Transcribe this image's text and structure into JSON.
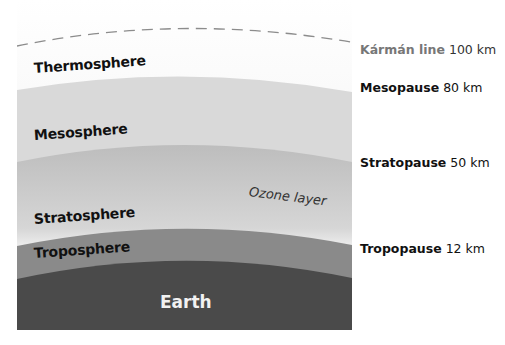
{
  "diagram": {
    "layers": [
      {
        "name": "Thermosphere"
      },
      {
        "name": "Mesosphere"
      },
      {
        "name": "Stratosphere"
      },
      {
        "name": "Troposphere"
      },
      {
        "name": "Earth"
      }
    ],
    "ozone_label": "Ozone layer",
    "boundaries": [
      {
        "name": "Kármán line",
        "altitude": "100 km"
      },
      {
        "name": "Mesopause",
        "altitude": "80 km"
      },
      {
        "name": "Stratopause",
        "altitude": "50 km"
      },
      {
        "name": "Tropopause",
        "altitude": "12 km"
      }
    ],
    "colors": {
      "thermosphere": "#ececec",
      "mesosphere": "#d9d9d9",
      "stratosphere_top": "#bdbdbd",
      "ozone_band": "#ffffff",
      "troposphere": "#8a8a8a",
      "earth": "#4a4a4a",
      "karman_line": "#8c8c8c"
    }
  }
}
